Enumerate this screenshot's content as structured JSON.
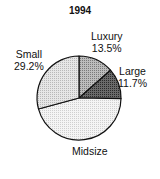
{
  "chart_data": {
    "type": "pie",
    "title": "1994",
    "categories": [
      "Luxury",
      "Large",
      "Midsize",
      "Small"
    ],
    "values": [
      13.5,
      11.7,
      45.6,
      29.2
    ],
    "value_labels": [
      "13.5%",
      "11.7%",
      "",
      "29.2%"
    ],
    "start_angle": "12 o'clock",
    "direction": "clockwise",
    "fills": [
      "#a8a8a8",
      "#505050",
      "#f2f2f2",
      "#dcdcdc"
    ],
    "legend": "none (direct labels)"
  },
  "labels": {
    "luxury": {
      "name": "Luxury",
      "pct": "13.5%"
    },
    "large": {
      "name": "Large",
      "pct": "11.7%"
    },
    "midsize": {
      "name": "Midsize"
    },
    "small": {
      "name": "Small",
      "pct": "29.2%"
    }
  }
}
